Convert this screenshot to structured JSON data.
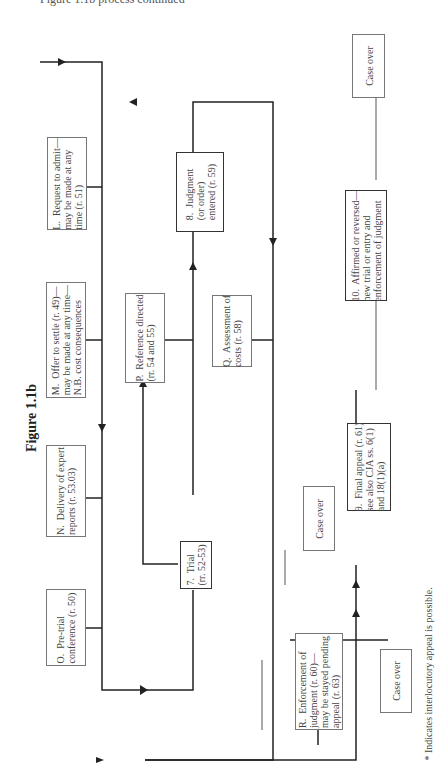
{
  "header": {
    "text_cut": "Figure 1.1b process continued"
  },
  "figure": {
    "title": "Figure 1.1b"
  },
  "boxes": {
    "L": {
      "label": "L.  Request to admit—\nmay be made at any\ntime (r. 51)"
    },
    "M": {
      "label": "M.  Offer to settle (r. 49)—\nmay be made at any time—\nN.B. cost consequences"
    },
    "N": {
      "label": "N.  Delivery of expert\nreports (r. 53.03)"
    },
    "O": {
      "label": "O.  Pre-trial\nconference (r. 50)"
    },
    "P": {
      "label": "P.  Reference directed\n(rr. 54 and 55)"
    },
    "Q": {
      "label": "Q.  Assessment of\ncosts (r. 58)"
    },
    "R": {
      "label": "R.  Enforcement of\njudgment (r. 60)—\nmay be stayed pending\nappeal (r. 63)"
    },
    "trial": {
      "label": "7.  Trial\n(rr. 52-53)"
    },
    "judgment": {
      "label": "8.  Judgment\n(or order)\nentered (r. 59)"
    },
    "final_appeal": {
      "label": "9.  Final appeal (r. 61)\nsee also CJA ss. 6(1)\nand 18(1)(a)"
    },
    "affirmed": {
      "label": "10.  Affirmed or reversed—\nnew trial or entry and\nenforcement of judgment"
    },
    "case_over_top": {
      "label": "Case over"
    },
    "case_over_mid": {
      "label": "Case over"
    },
    "case_over_bottom": {
      "label": "Case over"
    }
  },
  "footnote": {
    "text": "*  Indicates interlocutory appeal is possible."
  }
}
